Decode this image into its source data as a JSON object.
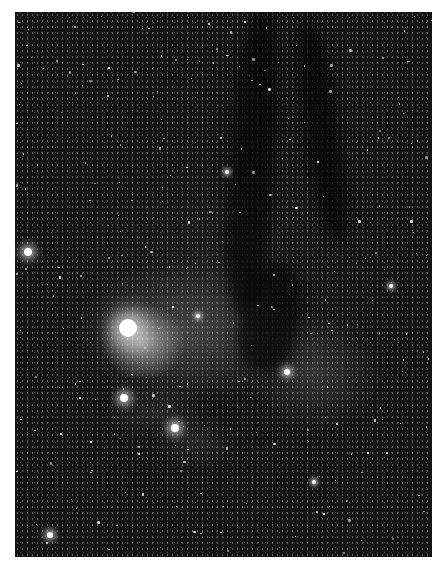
{
  "image": {
    "description": "Grayscale astrophotograph of a star field with bright reflection nebulae and dark dust lanes",
    "colors": {
      "background": "#ffffff",
      "sky": "#141414",
      "nebula": "#cfcfcf",
      "dust": "#050505"
    },
    "bright_stars": [
      {
        "x": 28,
        "y": 252,
        "r": 4
      },
      {
        "x": 128,
        "y": 328,
        "r": 9
      },
      {
        "x": 124,
        "y": 398,
        "r": 4
      },
      {
        "x": 175,
        "y": 428,
        "r": 4
      },
      {
        "x": 198,
        "y": 316,
        "r": 2
      },
      {
        "x": 287,
        "y": 372,
        "r": 3
      },
      {
        "x": 391,
        "y": 286,
        "r": 2
      },
      {
        "x": 227,
        "y": 172,
        "r": 2
      },
      {
        "x": 50,
        "y": 535,
        "r": 3
      },
      {
        "x": 314,
        "y": 482,
        "r": 2
      }
    ]
  }
}
